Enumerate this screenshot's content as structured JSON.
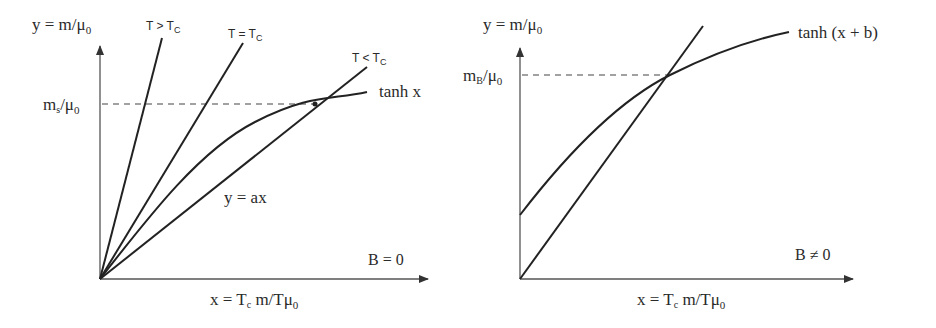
{
  "left_panel": {
    "y_axis_label": {
      "main": "y = m/μ",
      "sub": "0"
    },
    "x_axis_label": {
      "pre": "x = T",
      "sub1": "c",
      "mid": " m/Tμ",
      "sub2": "0"
    },
    "level_label": {
      "main": "m",
      "sub1": "s",
      "mid": "/μ",
      "sub2": "0"
    },
    "line_labels": {
      "t_above": {
        "main": "T > T",
        "sub": "C"
      },
      "t_equal": {
        "main": "T = T",
        "sub": "C"
      },
      "t_below": {
        "main": "T < T",
        "sub": "C"
      }
    },
    "curve_label": "tanh x",
    "line_eq_label": "y = ax",
    "condition": "B = 0"
  },
  "right_panel": {
    "y_axis_label": {
      "main": "y = m/μ",
      "sub": "0"
    },
    "x_axis_label": {
      "pre": "x = T",
      "sub1": "c",
      "mid": " m/Tμ",
      "sub2": "0"
    },
    "level_label": {
      "main": "m",
      "sub1": "B",
      "mid": "/μ",
      "sub2": "0"
    },
    "curve_label": "tanh (x + b)",
    "condition": "B ≠ 0"
  },
  "colors": {
    "ink": "#222222",
    "axis": "#555555",
    "background": "#ffffff"
  }
}
